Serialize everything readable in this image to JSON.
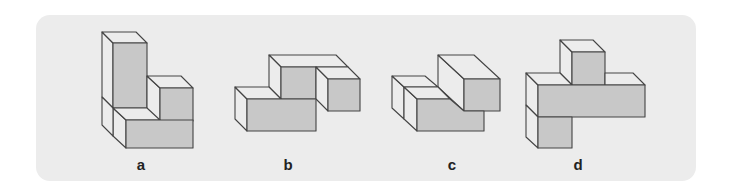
{
  "figure": {
    "panel_color": "#ececec",
    "face_front_color": "#c8c8c8",
    "face_light_color": "#ececec",
    "edge_color": "#444444",
    "items": [
      {
        "label": "a",
        "description": "L-shaped block assembly: tall column with a cube to the right and a base block in front"
      },
      {
        "label": "b",
        "description": "Stepped block assembly: low front block, raised middle block, right cube"
      },
      {
        "label": "c",
        "description": "Two-level block assembly: long lower block with a block stacked at the back-right"
      },
      {
        "label": "d",
        "description": "Cross/T-shaped assembly: horizontal bar with a cube on top and a cube below-left"
      }
    ]
  }
}
